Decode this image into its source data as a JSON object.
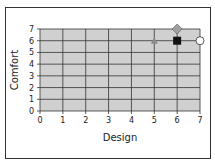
{
  "chart_data": {
    "type": "scatter",
    "title": "",
    "xlabel": "Design",
    "ylabel": "Comfort",
    "xlim": [
      0,
      7
    ],
    "ylim": [
      0,
      7
    ],
    "x_ticks": [
      "0",
      "1",
      "2",
      "3",
      "4",
      "5",
      "6",
      "7"
    ],
    "y_ticks": [
      "0",
      "1",
      "2",
      "3",
      "4",
      "5",
      "6",
      "7"
    ],
    "grid": true,
    "plot_background": "#d0d0d0",
    "series": [
      {
        "name": "triangle",
        "marker": "triangle",
        "color": "#8a8a8a",
        "x": 5,
        "y": 6
      },
      {
        "name": "diamond",
        "marker": "diamond",
        "color": "#a0a0a0",
        "x": 6,
        "y": 7
      },
      {
        "name": "square",
        "marker": "square",
        "color": "#111111",
        "x": 6,
        "y": 6
      },
      {
        "name": "circle",
        "marker": "circle",
        "color": "#ffffff",
        "x": 7,
        "y": 6
      }
    ]
  }
}
